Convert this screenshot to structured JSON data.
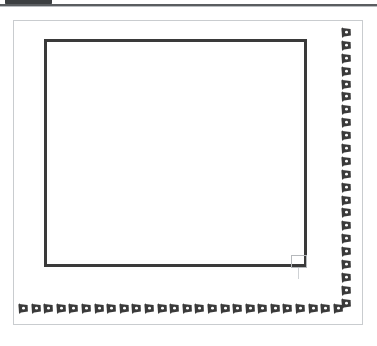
{
  "app_chrome": {
    "tab_label": "",
    "tab_color": "#3c3f41",
    "rule_color": "#5a5d60"
  },
  "document": {
    "page_border_color": "#c9cccf",
    "background_color": "#ffffff",
    "width_px": 350,
    "height_px": 305
  },
  "ornament": {
    "glyph_name": "flag-ornament",
    "glyph_color": "#3a3a3a",
    "glyph_highlight_color": "#ffffff",
    "right_strip_count": 22,
    "bottom_strip_count": 26,
    "description": "repeating slanted flag/ribbon border ornament"
  },
  "inner_frame": {
    "border_color": "#3a3a3a",
    "border_width_px": 3,
    "fill": "none"
  },
  "selection": {
    "handle_color": "#b6b9bc",
    "handle_name": "resize-handle"
  }
}
